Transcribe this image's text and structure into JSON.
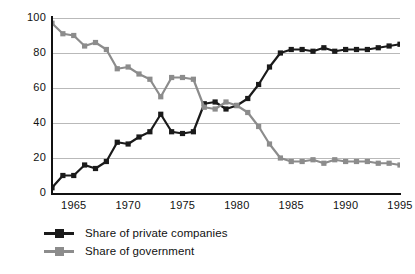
{
  "chart_data": {
    "type": "line",
    "title": "",
    "subtitle": "",
    "xlabel": "",
    "ylabel": "",
    "xlim": [
      1963,
      1995
    ],
    "ylim": [
      0,
      100
    ],
    "grid": true,
    "legend_position": "bottom-left",
    "x": [
      1963,
      1964,
      1965,
      1966,
      1967,
      1968,
      1969,
      1970,
      1971,
      1972,
      1973,
      1974,
      1975,
      1976,
      1977,
      1978,
      1979,
      1980,
      1981,
      1982,
      1983,
      1984,
      1985,
      1986,
      1987,
      1988,
      1989,
      1990,
      1991,
      1992,
      1993,
      1994,
      1995
    ],
    "xticks": [
      1965,
      1970,
      1975,
      1980,
      1985,
      1990,
      1995
    ],
    "xticklabels": [
      "1965",
      "1970",
      "1975",
      "1980",
      "1985",
      "1990",
      "1995"
    ],
    "yticks": [
      0,
      20,
      40,
      60,
      80,
      100
    ],
    "yticklabels": [
      "0",
      "20",
      "40",
      "60",
      "80",
      "100"
    ],
    "series": [
      {
        "name": "Share of private companies",
        "color": "#1a1a1a",
        "marker": "square",
        "values": [
          3,
          10,
          10,
          16,
          14,
          18,
          29,
          28,
          32,
          35,
          45,
          35,
          34,
          35,
          51,
          52,
          48,
          50,
          54,
          62,
          72,
          80,
          82,
          82,
          81,
          83,
          81,
          82,
          82,
          82,
          83,
          84,
          85
        ]
      },
      {
        "name": "Share of government",
        "color": "#8c8c8c",
        "marker": "square",
        "values": [
          97,
          91,
          90,
          84,
          86,
          82,
          71,
          72,
          68,
          65,
          55,
          66,
          66,
          65,
          49,
          48,
          52,
          50,
          46,
          38,
          28,
          20,
          18,
          18,
          19,
          17,
          19,
          18,
          18,
          18,
          17,
          17,
          16
        ]
      }
    ]
  },
  "legend": {
    "items": [
      {
        "label": "Share of private companies",
        "color": "#1a1a1a"
      },
      {
        "label": "Share of government",
        "color": "#8c8c8c"
      }
    ]
  }
}
